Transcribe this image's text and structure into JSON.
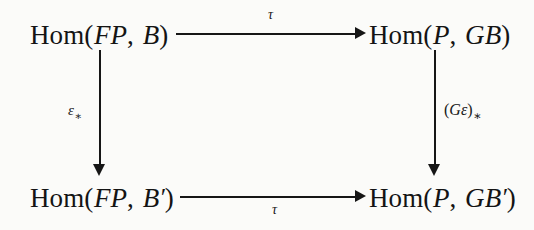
{
  "diagram": {
    "kind": "commutative-square",
    "nodes": {
      "top_left": {
        "text": "Hom(FP, B)",
        "func": "Hom",
        "args_italic": "FP",
        "target": "B"
      },
      "top_right": {
        "text": "Hom(P, GB)",
        "func": "Hom",
        "args_italic": "P",
        "target": "GB"
      },
      "bottom_left": {
        "text": "Hom(FP, B′)",
        "func": "Hom",
        "args_italic": "FP",
        "target": "B′"
      },
      "bottom_right": {
        "text": "Hom(P, GB′)",
        "func": "Hom",
        "args_italic": "P",
        "target": "GB′"
      }
    },
    "node_parts": {
      "hom": "Hom",
      "open_paren": "(",
      "close_paren": ")",
      "comma": ",",
      "FP": "FP",
      "P": "P",
      "B": "B",
      "GB": "GB",
      "prime": "′"
    },
    "edges": {
      "top": {
        "label": "τ",
        "from": "top_left",
        "to": "top_right",
        "direction": "right"
      },
      "bottom": {
        "label": "τ",
        "from": "bottom_left",
        "to": "bottom_right",
        "direction": "right"
      },
      "left": {
        "label_base": "ε",
        "label_sub": "∗",
        "from": "top_left",
        "to": "bottom_left",
        "direction": "down"
      },
      "right": {
        "label_base": "(Gε)",
        "label_sub": "∗",
        "from": "top_right",
        "to": "bottom_right",
        "direction": "down"
      }
    },
    "edge_label_right_parts": {
      "open": "(",
      "G": "G",
      "epsilon": "ε",
      "close": ")",
      "sub": "∗"
    },
    "colors": {
      "ink": "#161616",
      "background": "#fbfbf9"
    }
  }
}
